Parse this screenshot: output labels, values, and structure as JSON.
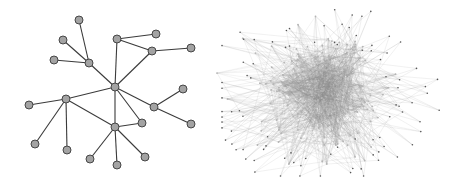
{
  "figure": {
    "width": 457,
    "height": 181,
    "background": "#ffffff"
  },
  "left_graph": {
    "description": "sparse tree-like network",
    "node_fill": "#a3a3a3",
    "node_stroke": "#3a3a3a",
    "edge_color": "#3a3a3a",
    "node_radius": 4,
    "nodes": [
      {
        "id": 0,
        "x": 79,
        "y": 20
      },
      {
        "id": 1,
        "x": 63,
        "y": 40
      },
      {
        "id": 2,
        "x": 54,
        "y": 60
      },
      {
        "id": 3,
        "x": 89,
        "y": 63
      },
      {
        "id": 4,
        "x": 117,
        "y": 39
      },
      {
        "id": 5,
        "x": 156,
        "y": 34
      },
      {
        "id": 6,
        "x": 152,
        "y": 51
      },
      {
        "id": 7,
        "x": 191,
        "y": 48
      },
      {
        "id": 8,
        "x": 115,
        "y": 87
      },
      {
        "id": 9,
        "x": 66,
        "y": 99
      },
      {
        "id": 10,
        "x": 29,
        "y": 105
      },
      {
        "id": 11,
        "x": 154,
        "y": 107
      },
      {
        "id": 12,
        "x": 183,
        "y": 89
      },
      {
        "id": 13,
        "x": 191,
        "y": 124
      },
      {
        "id": 14,
        "x": 142,
        "y": 123
      },
      {
        "id": 15,
        "x": 115,
        "y": 127
      },
      {
        "id": 16,
        "x": 35,
        "y": 144
      },
      {
        "id": 17,
        "x": 67,
        "y": 150
      },
      {
        "id": 18,
        "x": 90,
        "y": 159
      },
      {
        "id": 19,
        "x": 117,
        "y": 165
      },
      {
        "id": 20,
        "x": 145,
        "y": 157
      }
    ],
    "edges": [
      [
        0,
        3
      ],
      [
        1,
        3
      ],
      [
        2,
        3
      ],
      [
        3,
        8
      ],
      [
        4,
        8
      ],
      [
        4,
        5
      ],
      [
        4,
        6
      ],
      [
        6,
        7
      ],
      [
        6,
        8
      ],
      [
        8,
        9
      ],
      [
        8,
        11
      ],
      [
        8,
        14
      ],
      [
        8,
        15
      ],
      [
        9,
        10
      ],
      [
        9,
        15
      ],
      [
        9,
        16
      ],
      [
        9,
        17
      ],
      [
        11,
        12
      ],
      [
        11,
        13
      ],
      [
        15,
        14
      ],
      [
        15,
        18
      ],
      [
        15,
        19
      ],
      [
        15,
        20
      ]
    ]
  },
  "right_graph": {
    "description": "dense hairball network",
    "node_fill": "#9a9a9a",
    "edge_color": "#8c8c8c",
    "center": {
      "x": 320,
      "y": 95
    },
    "core_radius_x": 55,
    "core_radius_y": 55,
    "outer_radius": 105,
    "core_node_count": 260,
    "outer_node_count": 90,
    "edge_count": 1400,
    "seed": 42
  }
}
